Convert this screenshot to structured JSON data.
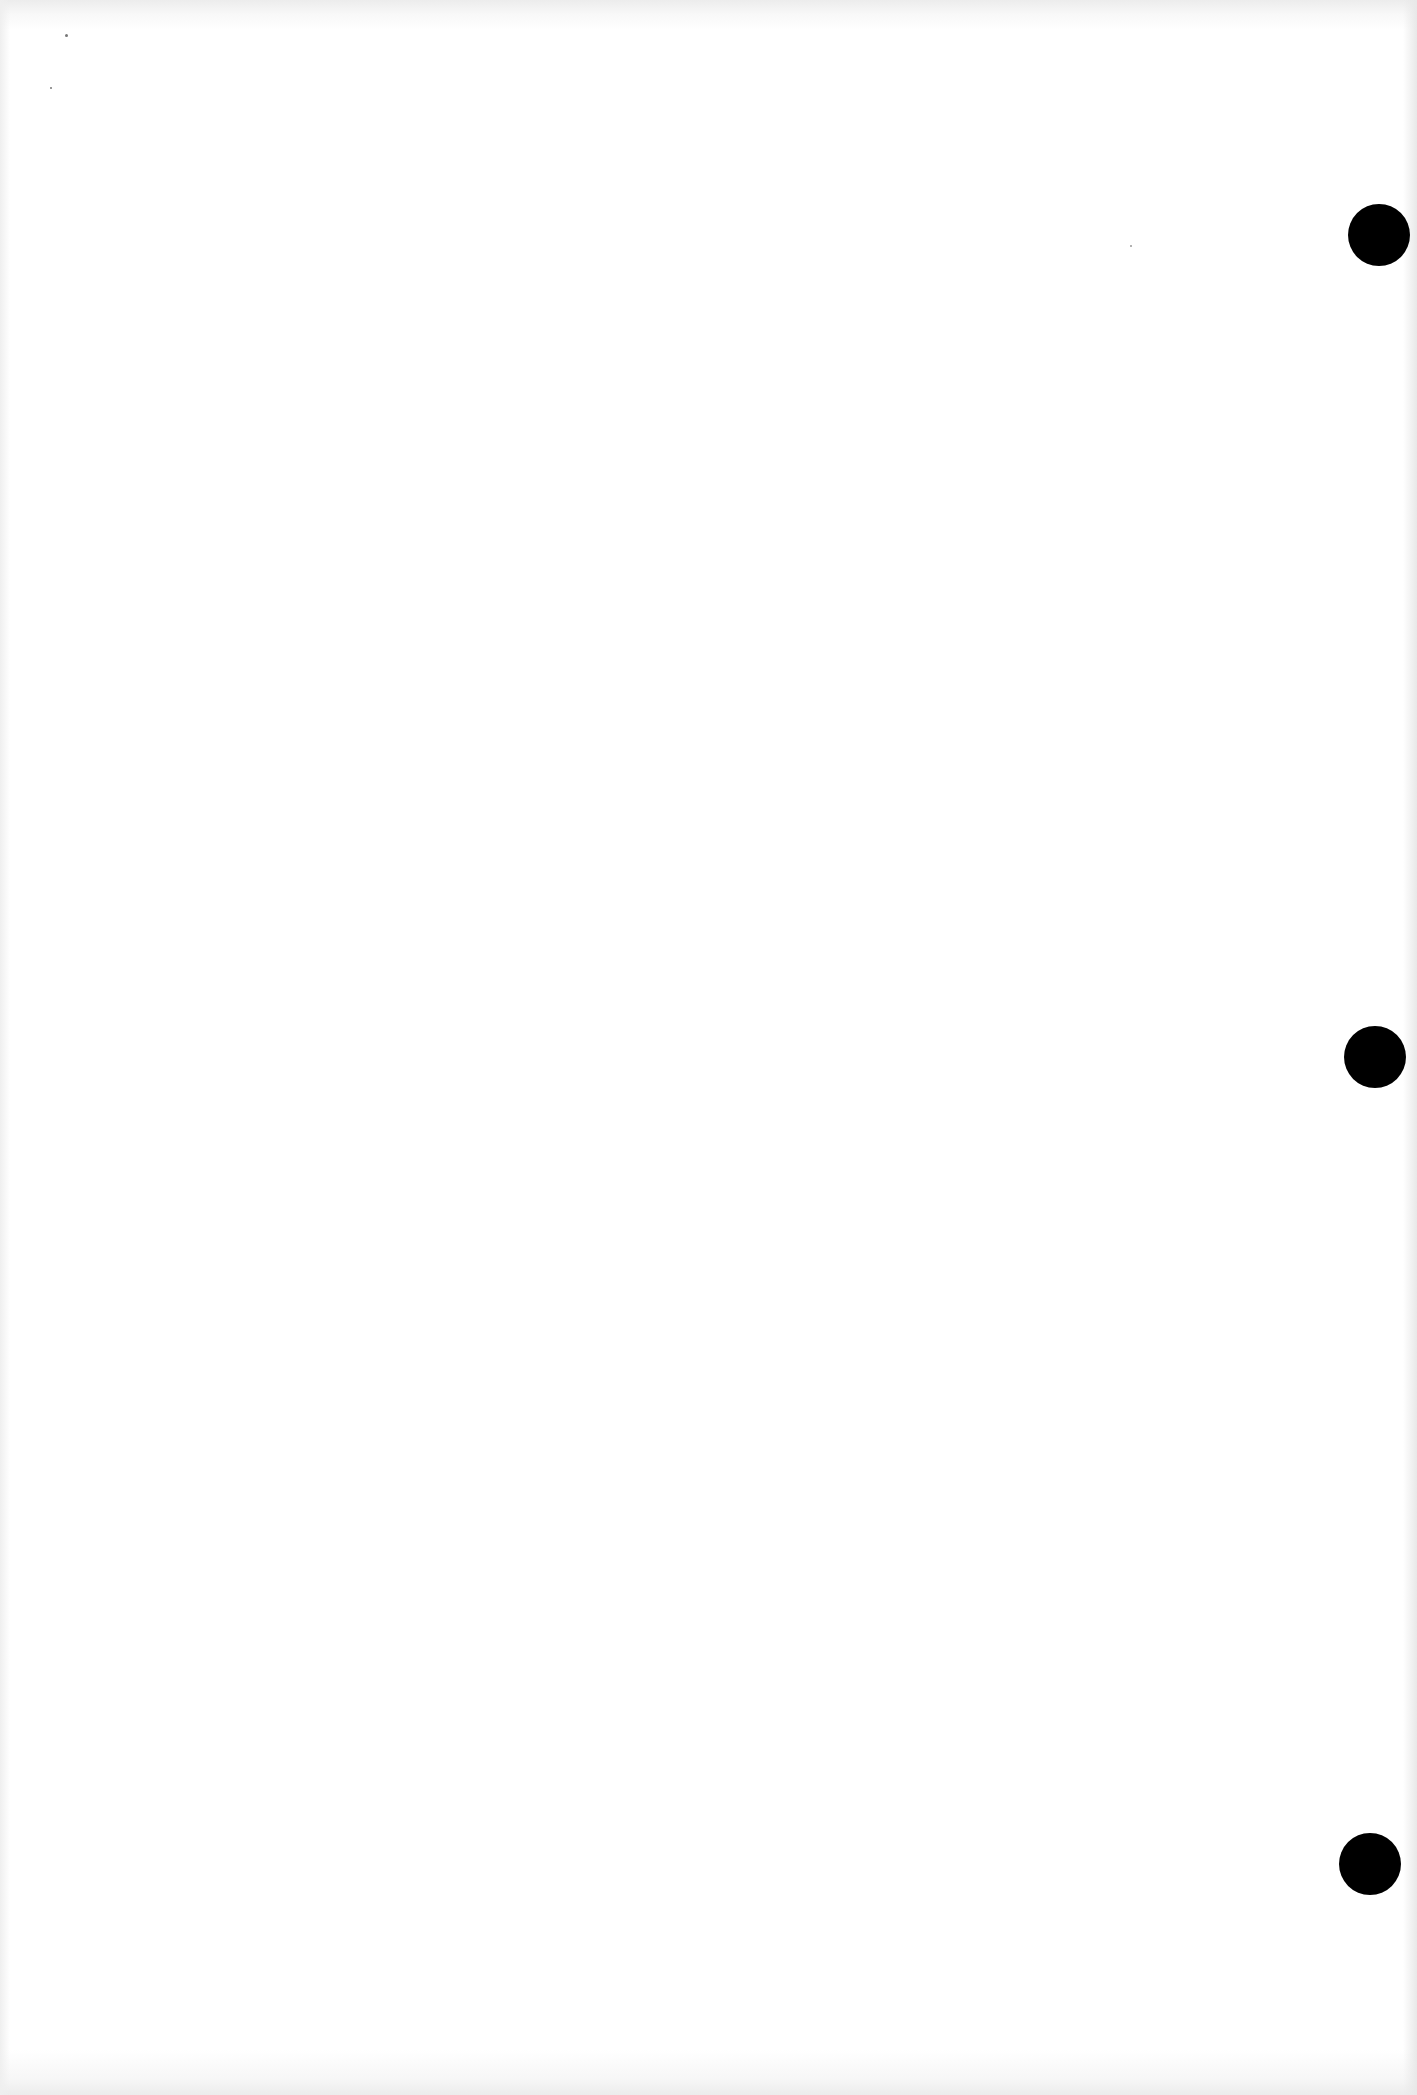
{
  "document": {
    "type": "blank scanned page",
    "text": "",
    "background_color": "#ffffff",
    "punch_holes": [
      {
        "cx": 1379,
        "cy": 235,
        "diameter": 62,
        "color": "#000000"
      },
      {
        "cx": 1375,
        "cy": 1057,
        "diameter": 62,
        "color": "#000000"
      },
      {
        "cx": 1370,
        "cy": 1864,
        "diameter": 62,
        "color": "#000000"
      }
    ]
  }
}
